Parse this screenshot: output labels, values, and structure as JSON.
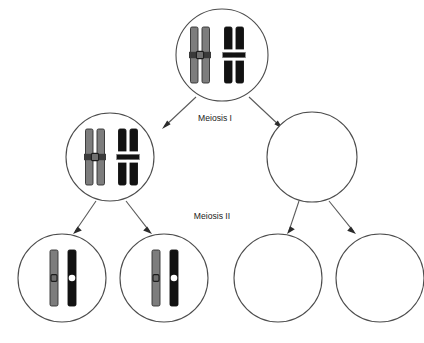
{
  "diagram": {
    "title": "Meiosis",
    "type": "biology-process-diagram",
    "background_color": "#ffffff",
    "outline_color": "#4d4d4d",
    "arrow_color": "#5a5a5a",
    "labels": [
      {
        "id": "meiosis-1",
        "text": "Meiosis I",
        "x": 215,
        "y": 119
      },
      {
        "id": "meiosis-2",
        "text": "Meiosis II",
        "x": 212,
        "y": 217
      }
    ],
    "chromosome_colors": {
      "gray": "#7d7d7d",
      "gray_outline": "#2f2f2f",
      "black": "#121212",
      "centromere_white": "#ffffff",
      "centromere_dark": "#3a3a3a"
    },
    "cells": [
      {
        "id": "parent-cell",
        "name": "parent-cell",
        "row": "top",
        "cx": 222,
        "cy": 55,
        "r": 46,
        "contents": "two homologous chromosome pairs, each duplicated into sister chromatids",
        "chromosomes": [
          {
            "color": "gray",
            "form": "duplicated",
            "x": 200,
            "y": 55
          },
          {
            "color": "black",
            "form": "duplicated",
            "x": 234,
            "y": 55
          }
        ]
      },
      {
        "id": "daughter-cell-1",
        "name": "daughter-cell-left",
        "row": "middle",
        "cx": 110,
        "cy": 157,
        "r": 44,
        "contents": "two duplicated chromosomes",
        "chromosomes": [
          {
            "color": "gray",
            "form": "duplicated",
            "x": 95,
            "y": 157
          },
          {
            "color": "black",
            "form": "duplicated",
            "x": 128,
            "y": 157
          }
        ]
      },
      {
        "id": "daughter-cell-2",
        "name": "daughter-cell-right",
        "row": "middle",
        "cx": 312,
        "cy": 157,
        "r": 45,
        "contents": "empty",
        "chromosomes": []
      },
      {
        "id": "gamete-cell-1",
        "name": "gamete-cell-1",
        "row": "bottom",
        "cx": 62,
        "cy": 278,
        "r": 44,
        "contents": "two single chromatids",
        "chromosomes": [
          {
            "color": "gray",
            "form": "single",
            "x": 54,
            "y": 278
          },
          {
            "color": "black",
            "form": "single",
            "x": 72,
            "y": 278
          }
        ]
      },
      {
        "id": "gamete-cell-2",
        "name": "gamete-cell-2",
        "row": "bottom",
        "cx": 164,
        "cy": 278,
        "r": 44,
        "contents": "two single chromatids",
        "chromosomes": [
          {
            "color": "gray",
            "form": "single",
            "x": 156,
            "y": 278
          },
          {
            "color": "black",
            "form": "single",
            "x": 174,
            "y": 278
          }
        ]
      },
      {
        "id": "gamete-cell-3",
        "name": "gamete-cell-3",
        "row": "bottom",
        "cx": 278,
        "cy": 278,
        "r": 44,
        "contents": "empty",
        "chromosomes": []
      },
      {
        "id": "gamete-cell-4",
        "name": "gamete-cell-4",
        "row": "bottom",
        "cx": 380,
        "cy": 278,
        "r": 44,
        "contents": "empty",
        "chromosomes": []
      }
    ],
    "arrows": [
      {
        "id": "arrow-parent-to-left",
        "from": "parent-cell",
        "to": "daughter-cell-1",
        "x1": 196,
        "y1": 97,
        "x2": 162,
        "y2": 129
      },
      {
        "id": "arrow-parent-to-right",
        "from": "parent-cell",
        "to": "daughter-cell-2",
        "x1": 249,
        "y1": 97,
        "x2": 283,
        "y2": 129
      },
      {
        "id": "arrow-left-to-g1",
        "from": "daughter-cell-1",
        "to": "gamete-cell-1",
        "x1": 96,
        "y1": 201,
        "x2": 73,
        "y2": 234
      },
      {
        "id": "arrow-left-to-g2",
        "from": "daughter-cell-1",
        "to": "gamete-cell-2",
        "x1": 126,
        "y1": 201,
        "x2": 152,
        "y2": 234
      },
      {
        "id": "arrow-right-to-g3",
        "from": "daughter-cell-2",
        "to": "gamete-cell-3",
        "x1": 299,
        "y1": 201,
        "x2": 287,
        "y2": 234
      },
      {
        "id": "arrow-right-to-g4",
        "from": "daughter-cell-2",
        "to": "gamete-cell-4",
        "x1": 329,
        "y1": 201,
        "x2": 356,
        "y2": 234
      }
    ]
  }
}
